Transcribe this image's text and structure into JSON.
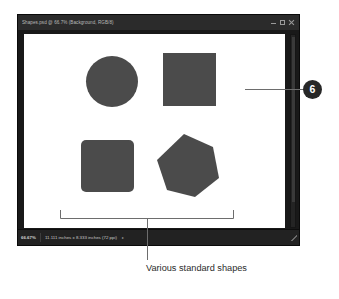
{
  "window": {
    "title": "Shapes.psd @ 66.7% (Background, RGB/8)",
    "controls": {
      "minimize_label": "Minimize",
      "maximize_label": "Maximize",
      "close_label": "Close"
    }
  },
  "status_bar": {
    "zoom": "66.67%",
    "dimensions": "11.111 inches x 8.333 inches (72 ppi)",
    "expand_arrow": "▸"
  },
  "canvas": {
    "background_color": "#ffffff",
    "shape_color": "#4b4b4b",
    "shapes": [
      {
        "name": "circle",
        "label": "Circle"
      },
      {
        "name": "square",
        "label": "Square"
      },
      {
        "name": "rounded-rect",
        "label": "Rounded rectangle"
      },
      {
        "name": "hexagon",
        "label": "Hexagon (polygon)"
      }
    ]
  },
  "annotations": {
    "caption": "Various standard shapes",
    "callout_number": "6"
  },
  "colors": {
    "window_chrome": "#191919",
    "title_bar": "#2b2b2b",
    "status_bar": "#222222",
    "annotation_line": "#6d6d6d",
    "callout_fill": "#272727",
    "page_background": "#ffffff"
  }
}
